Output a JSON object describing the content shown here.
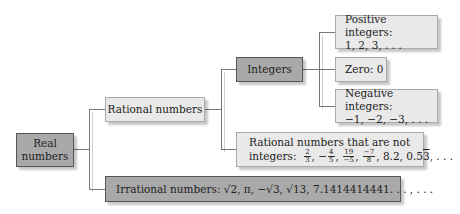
{
  "diagram": {
    "nodes": {
      "real": {
        "label_line1": "Real",
        "label_line2": "numbers"
      },
      "rational": {
        "label": "Rational numbers"
      },
      "irrational": {
        "label": "Irrational numbers:",
        "examples": "√2, π, −√3, √13, 7.1414414441. . . , . . ."
      },
      "integers": {
        "label": "Integers"
      },
      "positive": {
        "label": "Positive integers:",
        "examples": "1, 2, 3, . . ."
      },
      "zero": {
        "label": "Zero: 0"
      },
      "negative": {
        "label": "Negative integers:",
        "examples": "−1, −2, −3, . . ."
      },
      "non_integer_rational": {
        "label": "Rational numbers that are not",
        "label2": "integers:",
        "fractions": [
          {
            "num": "2",
            "den": "3",
            "sign": ""
          },
          {
            "num": "4",
            "den": "5",
            "sign": "−"
          },
          {
            "num": "19",
            "den": "−5",
            "sign": ""
          },
          {
            "num": "−7",
            "den": "8",
            "sign": ""
          }
        ],
        "decimal1": "8.2",
        "decimal2_base": "0.5",
        "decimal2_repeat": "3",
        "ellipsis": ". . ."
      }
    },
    "colors": {
      "dark_box": "#a9a9a9",
      "light_box": "#e9e9e9",
      "connector": "#777777"
    }
  }
}
